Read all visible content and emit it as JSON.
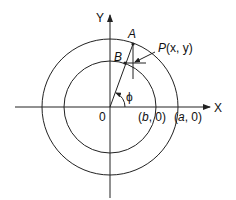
{
  "diagram": {
    "axes": {
      "x_label": "X",
      "y_label": "Y",
      "origin_label": "0"
    },
    "points": {
      "A": "A",
      "B": "B",
      "P": {
        "name": "P",
        "coords": "(x, y)"
      }
    },
    "angle_label": "ϕ",
    "intercepts": {
      "inner": {
        "prefix": "(",
        "var": "b",
        "suffix": ", 0)"
      },
      "outer": {
        "prefix": "(",
        "var": "a",
        "suffix": ", 0)"
      }
    },
    "colors": {
      "stroke": "#222222",
      "background": "#ffffff"
    }
  }
}
